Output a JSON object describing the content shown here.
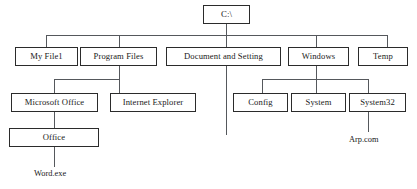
{
  "diagram": {
    "type": "tree-diagram",
    "colors": {
      "background": "#ffffff",
      "box_border": "#2b2b2b",
      "connector": "#55585c",
      "text": "#1a1a1a"
    },
    "nodes": {
      "root": {
        "label": "C:\\"
      },
      "my_file1": {
        "label": "My File1"
      },
      "program_files": {
        "label": "Program Files"
      },
      "document_and_setting": {
        "label": "Document and Setting"
      },
      "windows": {
        "label": "Windows"
      },
      "temp": {
        "label": "Temp"
      },
      "microsoft_office": {
        "label": "Microsoft Office"
      },
      "internet_explorer": {
        "label": "Internet Explorer"
      },
      "config": {
        "label": "Config"
      },
      "system": {
        "label": "System"
      },
      "system32": {
        "label": "System32"
      },
      "office": {
        "label": "Office"
      },
      "word_exe": {
        "label": "Word.exe"
      },
      "arp_com": {
        "label": "Arp.com"
      }
    },
    "hierarchy": [
      {
        "label": "C:\\",
        "children": [
          {
            "label": "My File1",
            "children": []
          },
          {
            "label": "Program Files",
            "children": [
              {
                "label": "Microsoft Office",
                "children": [
                  {
                    "label": "Office",
                    "children": [
                      {
                        "label": "Word.exe",
                        "children": []
                      }
                    ]
                  }
                ]
              },
              {
                "label": "Internet Explorer",
                "children": []
              }
            ]
          },
          {
            "label": "Document and Setting",
            "children": []
          },
          {
            "label": "Windows",
            "children": [
              {
                "label": "Config",
                "children": []
              },
              {
                "label": "System",
                "children": []
              },
              {
                "label": "System32",
                "children": [
                  {
                    "label": "Arp.com",
                    "children": []
                  }
                ]
              }
            ]
          },
          {
            "label": "Temp",
            "children": []
          }
        ]
      }
    ]
  }
}
